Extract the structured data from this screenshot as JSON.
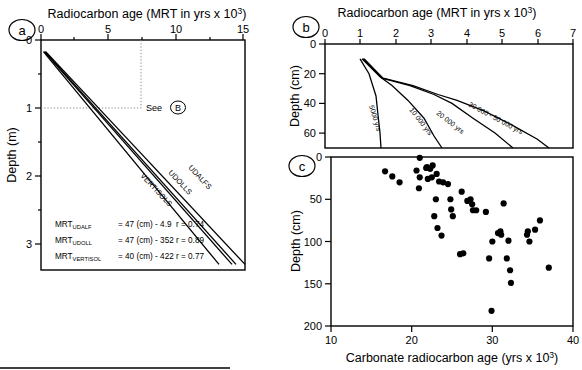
{
  "figure": {
    "panels": [
      "a",
      "b",
      "c"
    ]
  },
  "panel_a": {
    "id": "a",
    "title": "Radiocarbon age (MRT in yrs x 10",
    "title_sup": "3",
    "title_close": ")",
    "xlabel": "Radiocarbon age (MRT in yrs x 10³)",
    "ylabel": "Depth (m)",
    "xticks": [
      "0",
      "5",
      "10",
      "15"
    ],
    "yticks": [
      "0",
      "1",
      "2",
      "3"
    ],
    "annotation": "See",
    "annotation_ref": "B",
    "series_labels": [
      "UDALFS",
      "UDOLLS",
      "VERTISOLS"
    ],
    "equations": [
      {
        "name": "MRT",
        "sub": "UDALF",
        "body": "= 47 (cm) - 4.9",
        "r": "r = 0.74"
      },
      {
        "name": "MRT",
        "sub": "UDOLL",
        "body": "= 47 (cm) - 352",
        "r": "r = 0.89"
      },
      {
        "name": "MRT",
        "sub": "VERTISOL",
        "body": "= 40 (cm) - 422",
        "r": "r = 0.77"
      }
    ]
  },
  "panel_b": {
    "id": "b",
    "xlabel": "Radiocarbon age (MRT in yrs x 10³)",
    "ylabel": "Depth (cm)",
    "xticks": [
      "0",
      "1",
      "2",
      "3",
      "4",
      "5",
      "6",
      "7"
    ],
    "yticks": [
      "0",
      "20",
      "40",
      "60"
    ],
    "curve_labels": [
      "5000 yrs",
      "10 000 yrs",
      "20 000 yrs",
      "30 000 - 50 000 yrs"
    ]
  },
  "panel_c": {
    "id": "c",
    "xlabel": "Carbonate radiocarbon age (yrs x 10³)",
    "ylabel": "Depth (cm)",
    "xticks": [
      "10",
      "20",
      "30",
      "40"
    ],
    "yticks": [
      "0",
      "50",
      "100",
      "150",
      "200"
    ]
  },
  "chart_data": [
    {
      "type": "line",
      "panel": "a",
      "title": "Radiocarbon age (MRT in yrs x 10³)",
      "xlabel": "Radiocarbon age (MRT in yrs x 10³)",
      "ylabel": "Depth (m)",
      "xlim": [
        0,
        15
      ],
      "ylim": [
        0,
        3.35
      ],
      "y_inverted": true,
      "grid": false,
      "legend": "inline-curve-labels",
      "series": [
        {
          "name": "UDALFS",
          "x": [
            0.35,
            15.0
          ],
          "y": [
            0.17,
            3.3
          ],
          "equation": "MRT_UDALF = 47 (cm) - 4.9",
          "r": 0.74
        },
        {
          "name": "UDOLLS",
          "x": [
            0.3,
            14.3
          ],
          "y": [
            0.17,
            3.3
          ],
          "equation": "MRT_UDOLL = 47 (cm) - 352",
          "r": 0.89
        },
        {
          "name": "VERTISOLS",
          "x": [
            0.25,
            13.2
          ],
          "y": [
            0.17,
            3.3
          ],
          "equation": "MRT_VERTISOL = 40 (cm) - 422",
          "r": 0.77
        }
      ],
      "annotations": [
        {
          "text": "See (B)",
          "x": 7.4,
          "y": 1.0,
          "guide": "dotted crosshair to x=7.4, y=1.0"
        }
      ]
    },
    {
      "type": "line",
      "panel": "b",
      "title": "Radiocarbon age (MRT in yrs x 10³)",
      "xlabel": "Radiocarbon age (MRT in yrs x 10³)",
      "ylabel": "Depth (cm)",
      "xlim": [
        0,
        7
      ],
      "ylim": [
        0,
        70
      ],
      "y_inverted": true,
      "grid": false,
      "series": [
        {
          "name": "5000 yrs",
          "x": [
            1.0,
            1.25,
            1.45,
            1.5,
            1.55,
            1.6
          ],
          "y": [
            10,
            20,
            35,
            48,
            60,
            70
          ]
        },
        {
          "name": "10 000 yrs",
          "x": [
            1.05,
            1.55,
            1.9,
            2.35,
            2.8,
            3.1,
            3.3
          ],
          "y": [
            10,
            22,
            28,
            38,
            50,
            62,
            70
          ]
        },
        {
          "name": "20 000 yrs",
          "x": [
            1.08,
            1.6,
            2.4,
            3.1,
            3.6,
            4.2,
            4.8,
            5.3
          ],
          "y": [
            10,
            23,
            28,
            34,
            40,
            50,
            60,
            70
          ]
        },
        {
          "name": "30 000 - 50 000 yrs",
          "x": [
            1.12,
            1.65,
            2.5,
            3.2,
            3.75,
            4.5,
            5.3,
            6.0,
            6.35
          ],
          "y": [
            10,
            23,
            28,
            34,
            38,
            45,
            55,
            64,
            70
          ]
        }
      ]
    },
    {
      "type": "scatter",
      "panel": "c",
      "xlabel": "Carbonate radiocarbon age (yrs x 10³)",
      "ylabel": "Depth (cm)",
      "xlim": [
        10,
        40
      ],
      "ylim": [
        0,
        200
      ],
      "y_inverted": true,
      "grid": false,
      "marker": "filled-circle",
      "points": [
        [
          21.0,
          1
        ],
        [
          16.7,
          17
        ],
        [
          17.6,
          23
        ],
        [
          18.5,
          30
        ],
        [
          20.6,
          16
        ],
        [
          21.0,
          24
        ],
        [
          20.9,
          37
        ],
        [
          21.8,
          13
        ],
        [
          21.9,
          12
        ],
        [
          22.3,
          14
        ],
        [
          22.0,
          26
        ],
        [
          22.6,
          10
        ],
        [
          22.5,
          24
        ],
        [
          23.1,
          20
        ],
        [
          23.4,
          29
        ],
        [
          23.9,
          30
        ],
        [
          23.0,
          50
        ],
        [
          22.8,
          70
        ],
        [
          23.2,
          84
        ],
        [
          23.7,
          93
        ],
        [
          24.5,
          32
        ],
        [
          24.8,
          50
        ],
        [
          24.9,
          62
        ],
        [
          25.1,
          70
        ],
        [
          26.2,
          41
        ],
        [
          26.0,
          115
        ],
        [
          26.4,
          114
        ],
        [
          26.9,
          52
        ],
        [
          27.3,
          50
        ],
        [
          27.5,
          56
        ],
        [
          27.6,
          63
        ],
        [
          28.0,
          63
        ],
        [
          29.2,
          65
        ],
        [
          29.6,
          120
        ],
        [
          30.0,
          100
        ],
        [
          30.7,
          90
        ],
        [
          31.0,
          88
        ],
        [
          31.1,
          92
        ],
        [
          31.4,
          55
        ],
        [
          31.8,
          120
        ],
        [
          32.0,
          99
        ],
        [
          32.2,
          134
        ],
        [
          32.3,
          149
        ],
        [
          29.9,
          182
        ],
        [
          34.3,
          92
        ],
        [
          34.4,
          88
        ],
        [
          34.6,
          100
        ],
        [
          35.3,
          86
        ],
        [
          35.9,
          75
        ],
        [
          37.0,
          131
        ]
      ]
    }
  ]
}
